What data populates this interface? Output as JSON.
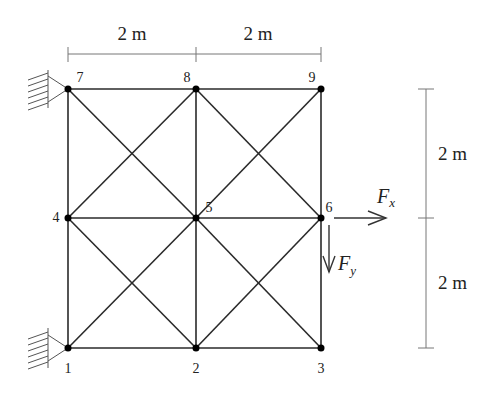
{
  "diagram": {
    "type": "plane-truss",
    "nodes": [
      {
        "id": "1",
        "x": 68,
        "y": 348,
        "label": "1"
      },
      {
        "id": "2",
        "x": 196,
        "y": 348,
        "label": "2"
      },
      {
        "id": "3",
        "x": 321,
        "y": 348,
        "label": "3"
      },
      {
        "id": "4",
        "x": 68,
        "y": 218,
        "label": "4"
      },
      {
        "id": "5",
        "x": 196,
        "y": 218,
        "label": "5"
      },
      {
        "id": "6",
        "x": 321,
        "y": 218,
        "label": "6"
      },
      {
        "id": "7",
        "x": 68,
        "y": 89,
        "label": "7"
      },
      {
        "id": "8",
        "x": 196,
        "y": 89,
        "label": "8"
      },
      {
        "id": "9",
        "x": 321,
        "y": 89,
        "label": "9"
      }
    ],
    "supports": [
      {
        "node": "7",
        "type": "pin-wall"
      },
      {
        "node": "1",
        "type": "pin-wall"
      }
    ],
    "dimensions": {
      "top_left": "2 m",
      "top_right": "2 m",
      "right_upper": "2 m",
      "right_lower": "2 m"
    },
    "loads": {
      "fx": {
        "node": "6",
        "symbol": "F",
        "subscript": "x",
        "direction": "right"
      },
      "fy": {
        "node": "6",
        "symbol": "F",
        "subscript": "y",
        "direction": "down"
      }
    }
  }
}
